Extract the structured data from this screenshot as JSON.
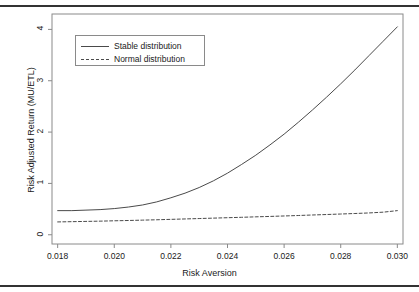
{
  "chart_data": {
    "type": "line",
    "title": "",
    "xlabel": "Risk Aversion",
    "ylabel": "Risk Adjusted Return (MU/ETL)",
    "xlim": [
      0.0178,
      0.0302
    ],
    "ylim": [
      -0.18,
      4.3
    ],
    "xticks": [
      "0.018",
      "0.020",
      "0.022",
      "0.024",
      "0.026",
      "0.028",
      "0.030"
    ],
    "xtick_values": [
      0.018,
      0.02,
      0.022,
      0.024,
      0.026,
      0.028,
      0.03
    ],
    "yticks": [
      "0",
      "1",
      "2",
      "3",
      "4"
    ],
    "ytick_values": [
      0,
      1,
      2,
      3,
      4
    ],
    "grid": false,
    "legend_position": "top-left",
    "x": [
      0.018,
      0.0185,
      0.019,
      0.0195,
      0.02,
      0.0205,
      0.021,
      0.0215,
      0.022,
      0.0225,
      0.023,
      0.0235,
      0.024,
      0.0245,
      0.025,
      0.0255,
      0.026,
      0.0265,
      0.027,
      0.0275,
      0.028,
      0.0285,
      0.029,
      0.0295,
      0.03
    ],
    "series": [
      {
        "name": "Stable distribution",
        "style": "solid",
        "color": "#4a4a4a",
        "values": [
          0.47,
          0.47,
          0.48,
          0.49,
          0.51,
          0.54,
          0.58,
          0.64,
          0.72,
          0.81,
          0.92,
          1.05,
          1.2,
          1.37,
          1.55,
          1.75,
          1.96,
          2.19,
          2.43,
          2.68,
          2.94,
          3.21,
          3.49,
          3.77,
          4.05
        ]
      },
      {
        "name": "Normal distribution",
        "style": "dashed",
        "color": "#4a4a4a",
        "values": [
          0.25,
          0.255,
          0.26,
          0.265,
          0.272,
          0.278,
          0.285,
          0.292,
          0.3,
          0.308,
          0.316,
          0.324,
          0.332,
          0.34,
          0.349,
          0.357,
          0.366,
          0.375,
          0.385,
          0.394,
          0.404,
          0.414,
          0.425,
          0.44,
          0.47
        ]
      }
    ]
  },
  "legend": {
    "items": [
      {
        "label": "Stable distribution",
        "style": "solid"
      },
      {
        "label": "Normal distribution",
        "style": "dashed"
      }
    ]
  },
  "axes": {
    "x_title": "Risk Aversion",
    "y_title": "Risk Adjusted Return (MU/ETL)"
  }
}
